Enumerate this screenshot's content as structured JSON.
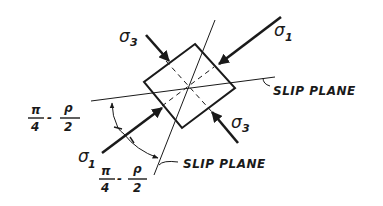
{
  "diagram": {
    "type": "stress-element-slip-planes",
    "colors": {
      "ink": "#1a1a1a",
      "background": "#ffffff"
    },
    "labels": {
      "sigma1_upper": {
        "symbol": "σ",
        "subscript": "1"
      },
      "sigma1_lower": {
        "symbol": "σ",
        "subscript": "1"
      },
      "sigma3_upper": {
        "symbol": "σ",
        "subscript": "3"
      },
      "sigma3_lower": {
        "symbol": "σ",
        "subscript": "3"
      },
      "slip_plane_right": "SLIP PLANE",
      "slip_plane_bottom": "SLIP PLANE",
      "angle_left": {
        "num1": "π",
        "den1": "4",
        "minus": "-",
        "num2": "ρ",
        "den2": "2"
      },
      "angle_bottom": {
        "num1": "π",
        "den1": "4",
        "minus": "-",
        "num2": "ρ",
        "den2": "2"
      }
    },
    "elements": {
      "square_element": "rotated square stress element",
      "slip_plane_lines": 2,
      "principal_stress_arrows": [
        "sigma1",
        "sigma1",
        "sigma3",
        "sigma3"
      ],
      "angle_arc": "double-headed arc between slip planes"
    }
  }
}
